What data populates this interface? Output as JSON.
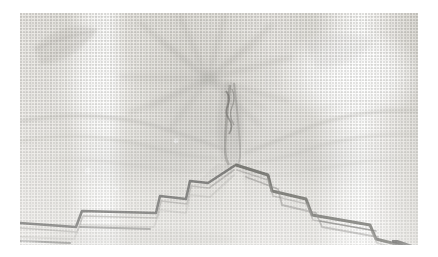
{
  "image": {
    "domain": "Natural-Image",
    "kind": "scanned-halftone-photograph",
    "subject": "sheer patterned curtain valance with gathered center and stepped hem",
    "canvas": {
      "width": 438,
      "height": 257,
      "background_color": "#ffffff"
    },
    "photo_plate": {
      "x": 20,
      "y": 13,
      "width": 398,
      "height": 232
    },
    "palette": {
      "paper_white": "#ffffff",
      "fabric_light": "#f6f5f3",
      "fabric_mid": "#e6e4df",
      "fabric_shadow": "#cfcdc8",
      "hem_dark": "#4a4a46",
      "hem_darkest": "#2e2e2b",
      "motif_grey": "#b8b6b1",
      "highlight": "#fdfdfc"
    },
    "regions": [
      {
        "name": "upper-floral-panel",
        "description": "radiating star-flower motif printed on sheer fabric",
        "x": 120,
        "y": 10,
        "width": 180,
        "height": 90
      },
      {
        "name": "left-leaf-motif",
        "description": "diagonal leaf / petal shape upper left",
        "x": 22,
        "y": 15,
        "width": 80,
        "height": 70
      },
      {
        "name": "gathered-center",
        "description": "vertical gathered crease forming V notch",
        "x": 195,
        "y": 85,
        "width": 60,
        "height": 80
      },
      {
        "name": "left-stepped-hem",
        "description": "scalloped stepped hem descending left with dark edge",
        "x": 20,
        "y": 140,
        "width": 170,
        "height": 100
      },
      {
        "name": "right-stepped-hem",
        "description": "scalloped stepped hem descending right with dark edge",
        "x": 230,
        "y": 140,
        "width": 190,
        "height": 110
      },
      {
        "name": "right-highlight",
        "description": "bright blown-out window light on right third",
        "x": 320,
        "y": 40,
        "width": 100,
        "height": 60
      }
    ],
    "stripe_bands": [
      {
        "center_x": 0.17,
        "tone": "light"
      },
      {
        "center_x": 0.22,
        "tone": "lightest"
      },
      {
        "center_x": 0.52,
        "tone": "mid"
      },
      {
        "center_x": 0.8,
        "tone": "light"
      },
      {
        "center_x": 0.86,
        "tone": "lightest"
      }
    ],
    "hem_profile": {
      "description": "inverted-V hem apex at gathered center, stepped notches stepping down to both outer corners",
      "apex": {
        "x": 217,
        "y": 152
      },
      "left_end": {
        "x": 20,
        "y": 228
      },
      "right_end": {
        "x": 412,
        "y": 238
      },
      "step_count_left": 3,
      "step_count_right": 4
    }
  }
}
